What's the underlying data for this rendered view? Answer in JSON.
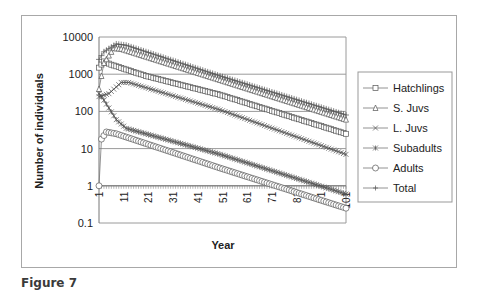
{
  "caption": "Figure 7",
  "chart_data": {
    "type": "line",
    "title": "",
    "xlabel": "Year",
    "ylabel": "Number of individuals",
    "yscale": "log",
    "ylim": [
      0.1,
      10000
    ],
    "yticks": [
      "10000",
      "1000",
      "100",
      "10",
      "1",
      "0.1"
    ],
    "xticks": [
      "1",
      "11",
      "21",
      "31",
      "41",
      "51",
      "61",
      "71",
      "81",
      "91",
      "101"
    ],
    "xlim": [
      1,
      101
    ],
    "grid": "horizontal",
    "legend_position": "right",
    "series": [
      {
        "name": "Hatchlings",
        "marker": "square",
        "key_points": [
          [
            1,
            1500
          ],
          [
            3,
            2200
          ],
          [
            6,
            1800
          ],
          [
            20,
            900
          ],
          [
            50,
            280
          ],
          [
            101,
            25
          ]
        ]
      },
      {
        "name": "S. Juvs",
        "marker": "triangle",
        "key_points": [
          [
            1,
            400
          ],
          [
            3,
            2000
          ],
          [
            7,
            5000
          ],
          [
            10,
            4800
          ],
          [
            50,
            700
          ],
          [
            101,
            60
          ]
        ]
      },
      {
        "name": "L. Juvs",
        "marker": "x",
        "key_points": [
          [
            1,
            250
          ],
          [
            5,
            300
          ],
          [
            10,
            600
          ],
          [
            13,
            600
          ],
          [
            50,
            110
          ],
          [
            101,
            7
          ]
        ]
      },
      {
        "name": "Subadults",
        "marker": "star",
        "key_points": [
          [
            1,
            300
          ],
          [
            3,
            200
          ],
          [
            8,
            60
          ],
          [
            12,
            35
          ],
          [
            50,
            7
          ],
          [
            101,
            0.6
          ]
        ]
      },
      {
        "name": "Adults",
        "marker": "circle",
        "key_points": [
          [
            1,
            1
          ],
          [
            2,
            18
          ],
          [
            4,
            28
          ],
          [
            8,
            25
          ],
          [
            50,
            3
          ],
          [
            101,
            0.25
          ]
        ]
      },
      {
        "name": "Total",
        "marker": "plus",
        "key_points": [
          [
            1,
            2500
          ],
          [
            3,
            4000
          ],
          [
            8,
            6500
          ],
          [
            12,
            6000
          ],
          [
            50,
            900
          ],
          [
            101,
            80
          ]
        ]
      }
    ]
  }
}
